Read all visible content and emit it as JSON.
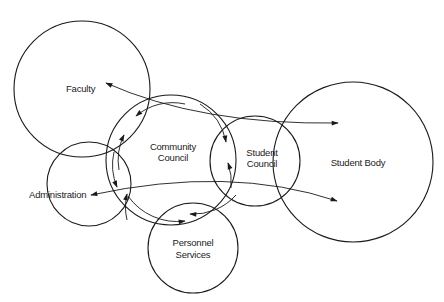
{
  "diagram": {
    "type": "venn-relationship",
    "nodes": [
      {
        "id": "faculty",
        "label_lines": [
          "Faculty"
        ]
      },
      {
        "id": "community_council",
        "label_lines": [
          "Community",
          "Council"
        ]
      },
      {
        "id": "student_council",
        "label_lines": [
          "Student",
          "Council"
        ]
      },
      {
        "id": "student_body",
        "label_lines": [
          "Student Body"
        ]
      },
      {
        "id": "administration",
        "label_lines": [
          "Administration"
        ]
      },
      {
        "id": "personnel_services",
        "label_lines": [
          "Personnel",
          "Services"
        ]
      }
    ],
    "edges": [
      {
        "from": "faculty",
        "to": "student_body",
        "direction": "both"
      },
      {
        "from": "administration",
        "to": "student_body",
        "direction": "both"
      },
      {
        "from": "community_council",
        "to": "faculty",
        "direction": "both"
      },
      {
        "from": "community_council",
        "to": "administration",
        "direction": "both"
      },
      {
        "from": "community_council",
        "to": "student_council",
        "direction": "both"
      },
      {
        "from": "community_council",
        "to": "personnel_services",
        "direction": "both"
      }
    ]
  },
  "labels": {
    "faculty": "Faculty",
    "community": "Community",
    "council": "Council",
    "student": "Student",
    "student_council_2": "Council",
    "student_body": "Student Body",
    "administration": "Administration",
    "personnel": "Personnel",
    "services": "Services"
  }
}
